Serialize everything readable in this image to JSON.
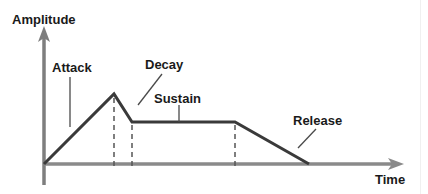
{
  "diagram": {
    "axes": {
      "y_label": "Amplitude",
      "x_label": "Time"
    },
    "phases": [
      {
        "name": "Attack",
        "label": "Attack"
      },
      {
        "name": "Decay",
        "label": "Decay"
      },
      {
        "name": "Sustain",
        "label": "Sustain"
      },
      {
        "name": "Release",
        "label": "Release"
      }
    ],
    "envelope_points": [
      {
        "x": 44,
        "y": 164
      },
      {
        "x": 114,
        "y": 94
      },
      {
        "x": 132,
        "y": 122
      },
      {
        "x": 235,
        "y": 122
      },
      {
        "x": 309,
        "y": 164
      }
    ],
    "colors": {
      "axis": "#7a7a7a",
      "envelope": "#3a3a3a",
      "text": "#1a1a1a",
      "dashed": "#555555"
    }
  }
}
